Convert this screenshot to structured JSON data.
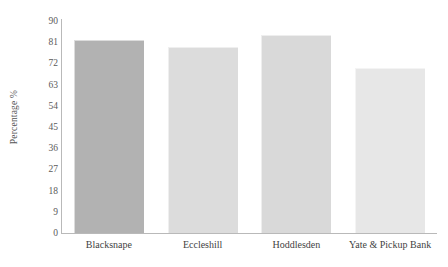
{
  "chart_data": {
    "type": "bar",
    "title": "",
    "subtitle": "",
    "xlabel": "",
    "ylabel": "Percentage %",
    "categories": [
      "Blacksnape",
      "Eccleshill",
      "Hoddlesden",
      "Yate & Pickup Bank"
    ],
    "values": [
      82,
      79,
      84,
      70
    ],
    "series": [
      {
        "name": "Percentage",
        "values": [
          82,
          79,
          84,
          70
        ]
      }
    ],
    "ylim": [
      0,
      90
    ],
    "yticks": [
      0,
      9,
      18,
      27,
      36,
      45,
      54,
      63,
      72,
      81,
      90
    ],
    "ytick_labels": [
      "0",
      "9",
      "18",
      "27",
      "36",
      "45",
      "54",
      "63",
      "72",
      "81",
      "90"
    ],
    "grid": false,
    "legend": false,
    "legend_position": "none",
    "bar_colors": [
      "#b2b2b2",
      "#dcdcdc",
      "#d9d9d9",
      "#e7e7e7"
    ],
    "axis_color": "#b9b9b9",
    "text_color": "#4a4a4a",
    "background": "#ffffff"
  }
}
